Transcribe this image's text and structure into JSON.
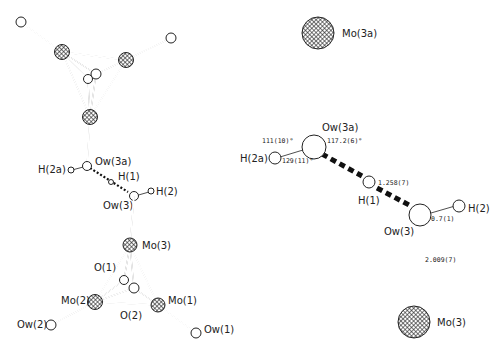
{
  "left_structure": {
    "labels": {
      "ow3a": "Ow(3a)",
      "h2a": "H(2a)",
      "h1": "H(1)",
      "h2": "H(2)",
      "ow3": "Ow(3)",
      "mo3": "Mo(3)",
      "o1": "O(1)",
      "mo2": "Mo(2)",
      "mo1": "Mo(1)",
      "o2": "O(2)",
      "ow2": "Ow(2)",
      "ow1": "Ow(1)"
    }
  },
  "right_structure": {
    "labels": {
      "mo3a": "Mo(3a)",
      "ow3a": "Ow(3a)",
      "h2a": "H(2a)",
      "h1": "H(1)",
      "h2": "H(2)",
      "ow3": "Ow(3)",
      "mo3": "Mo(3)"
    },
    "values": {
      "angle_h2a_ow3a_mo3a": "111(10)°",
      "angle_mo3a_ow3a_h1": "117.2(6)°",
      "angle_h2a_ow3a_h1": "129(11)°",
      "dist_ow3a_h1": "1.258(7)",
      "dist_ow3_h2": "0.7(1)",
      "dist_ow3_mo3": "2.009(7)"
    }
  }
}
